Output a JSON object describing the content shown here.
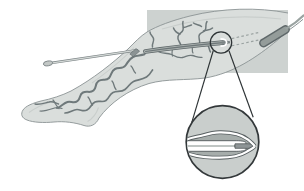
{
  "figure": {
    "kind": "medical-line-illustration",
    "components": [
      "leg-silhouette",
      "torso-panel",
      "varicose-veins",
      "saphenous-vein-trunk",
      "catheter-shaft",
      "catheter-hub",
      "insertion-sheath",
      "target-circle",
      "guide-dashes",
      "femoral-vein",
      "iliac-vein-line",
      "magnifier-cone",
      "magnifier-circle",
      "vein-walls",
      "catheter-tube",
      "fiber-tip"
    ]
  },
  "colors": {
    "background": "#ffffff",
    "torso_panel": "#cdd2d0",
    "leg_fill": "#dadedc",
    "leg_outline": "#8b9394",
    "shading": "#c8cdcb",
    "vein": "#6f797b",
    "vein_trunk_edge": "#5d6668",
    "vein_trunk_fill": "#a9b0ae",
    "catheter_line": "#6d7678",
    "catheter_shaft_fill": "#d3d8d6",
    "catheter_shaft_edge": "#7b8385",
    "hub_fill": "#c3c8c6",
    "sheath": "#8b9394",
    "sheath_edge": "#5f686a",
    "dashed_guide": "#9aa2a1",
    "femoral_vein_edge": "#5f686a",
    "femoral_vein_fill": "#949c9a",
    "iliac_line": "#9aa3a1",
    "magnifier_stroke": "#2e3436",
    "inset_fill": "#c9cecc",
    "inset_stroke": "#33383a",
    "inset_lumen": "#a6adab",
    "vein_wall_dark": "#575e60",
    "vein_wall_white": "#ffffff",
    "catheter_tube_fill": "#ffffff",
    "tube_stripe": "#bfc5c3",
    "fiber_tip_fill": "#8e9596",
    "tip_rod": "#7d8586"
  }
}
